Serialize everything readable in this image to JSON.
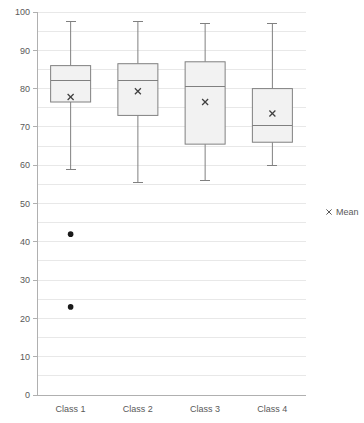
{
  "chart_data": {
    "type": "box",
    "title": "",
    "xlabel": "",
    "ylabel": "",
    "categories": [
      "Class 1",
      "Class 2",
      "Class 3",
      "Class 4"
    ],
    "ylim": [
      0,
      100
    ],
    "y_ticks": [
      0,
      10,
      20,
      30,
      40,
      50,
      60,
      70,
      80,
      90,
      100
    ],
    "y_tick_labels": [
      "0",
      "10",
      "20",
      "30",
      "40",
      "50",
      "60",
      "70",
      "80",
      "90",
      "100"
    ],
    "minor_gridline_step": 5,
    "grid": true,
    "legend": {
      "position": "right",
      "entries": [
        {
          "label": "Mean",
          "marker": "x",
          "color": "#595959"
        }
      ]
    },
    "boxes": [
      {
        "category": "Class 1",
        "whisker_low": 59,
        "q1": 76.5,
        "median": 82,
        "q3": 86,
        "whisker_high": 97.5,
        "mean": 77.8,
        "outliers": [
          42,
          23
        ]
      },
      {
        "category": "Class 2",
        "whisker_low": 55.5,
        "q1": 73,
        "median": 82,
        "q3": 86.5,
        "whisker_high": 97.5,
        "mean": 79.3,
        "outliers": []
      },
      {
        "category": "Class 3",
        "whisker_low": 56,
        "q1": 65.5,
        "median": 80.5,
        "q3": 87,
        "whisker_high": 97,
        "mean": 76.5,
        "outliers": []
      },
      {
        "category": "Class 4",
        "whisker_low": 59.8,
        "q1": 66,
        "median": 70.3,
        "q3": 80,
        "whisker_high": 97,
        "mean": 73.5,
        "outliers": []
      }
    ],
    "colors": {
      "box_fill": "#f2f2f2",
      "box_stroke": "#808080",
      "whisker": "#808080",
      "median": "#808080",
      "mean_marker": "#404040",
      "outlier": "#1a1a1a",
      "gridline": "#e8e8e8",
      "axis": "#b0b0b0",
      "tick_text": "#595959"
    }
  }
}
